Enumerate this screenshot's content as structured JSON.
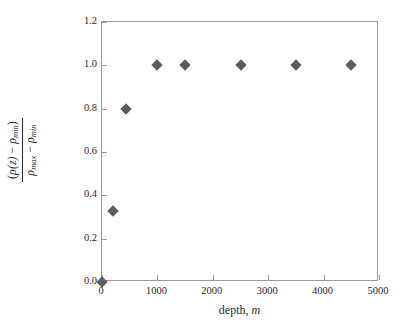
{
  "chart_data": {
    "type": "scatter",
    "title": "",
    "xlabel": "depth, m",
    "ylabel": "(ρ(z) − ρmin) / (ρmax − ρmin)",
    "xlim": [
      0,
      5000
    ],
    "ylim": [
      0,
      1.2
    ],
    "grid": false,
    "legend": "none",
    "x": [
      0,
      200,
      440,
      1000,
      1500,
      2500,
      3500,
      4500
    ],
    "values": [
      0.0,
      0.33,
      0.8,
      1.0,
      1.0,
      1.0,
      1.0,
      1.0
    ],
    "points": [
      {
        "x": 0,
        "y": 0.0
      },
      {
        "x": 200,
        "y": 0.33
      },
      {
        "x": 440,
        "y": 0.8
      },
      {
        "x": 1000,
        "y": 1.0
      },
      {
        "x": 1500,
        "y": 1.0
      },
      {
        "x": 2500,
        "y": 1.0
      },
      {
        "x": 3500,
        "y": 1.0
      },
      {
        "x": 4500,
        "y": 1.0
      }
    ],
    "marker": "diamond",
    "marker_color": "#5c5c5c",
    "axis_color": "#9a9a9a",
    "xticks": [
      0,
      1000,
      2000,
      3000,
      4000,
      5000
    ],
    "xtick_labels": [
      "0",
      "1000",
      "2000",
      "3000",
      "4000",
      "5000"
    ],
    "yticks": [
      0.0,
      0.2,
      0.4,
      0.6,
      0.8,
      1.0,
      1.2
    ],
    "ytick_labels": [
      "0.0",
      "0.2",
      "0.4",
      "0.6",
      "0.8",
      "1.0",
      "1.2"
    ]
  },
  "axis_titles": {
    "x_prefix": "depth,",
    "x_variable": "m",
    "y_numerator": {
      "open_paren": "(",
      "rho": "ρ",
      "arg": "(z)",
      "minus": "−",
      "rho2": "ρ",
      "sub": "min",
      "close_paren": ")"
    },
    "y_denominator": {
      "rho": "ρ",
      "sub_max": "max",
      "minus": "−",
      "rho2": "ρ",
      "sub_min": "min"
    }
  }
}
